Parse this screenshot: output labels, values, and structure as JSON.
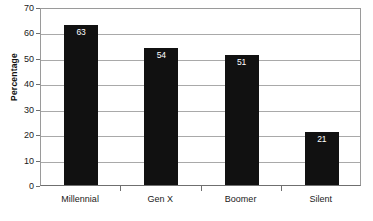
{
  "chart_data": {
    "type": "bar",
    "title": "",
    "subtitle": "",
    "xlabel": "",
    "ylabel": "Percentage",
    "categories": [
      "Millennial",
      "Gen X",
      "Boomer",
      "Silent"
    ],
    "values": [
      63,
      54,
      51,
      21
    ],
    "value_labels": [
      "63",
      "54",
      "51",
      "21"
    ],
    "series": [
      {
        "name": "Percentage",
        "values": [
          63,
          54,
          51,
          21
        ]
      }
    ],
    "ylim": [
      0,
      70
    ],
    "ytick_values": [
      70,
      60,
      50,
      40,
      30,
      20,
      10,
      0
    ],
    "ytick_labels": [
      "70",
      "60",
      "50",
      "40",
      "30",
      "20",
      "10",
      "0"
    ],
    "grid": true,
    "grid_axis": "y",
    "legend": false,
    "legend_position": "none",
    "bar_color": "#111111",
    "value_label_color": "#ffffff",
    "gridline_color": "#a9a9a9",
    "axis_color": "#6f6f6f",
    "background_color": "#ffffff"
  }
}
